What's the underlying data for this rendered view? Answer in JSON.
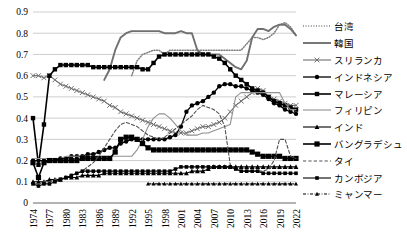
{
  "chart_data": {
    "type": "line",
    "title": "",
    "xlabel": "",
    "ylabel": "",
    "ylim": [
      0,
      0.9
    ],
    "grid": true,
    "legend_position": "right",
    "ytick_labels": [
      "0.9",
      "0.8",
      "0.7",
      "0.6",
      "0.5",
      "0.4",
      "0.3",
      "0.2",
      "0.1",
      "0"
    ],
    "ytick_values": [
      0.9,
      0.8,
      0.7,
      0.6,
      0.5,
      0.4,
      0.3,
      0.2,
      0.1,
      0
    ],
    "xtick_labels": [
      "1974",
      "1977",
      "1980",
      "1983",
      "1986",
      "1989",
      "1992",
      "1995",
      "1998",
      "2001",
      "2004",
      "2007",
      "2010",
      "2013",
      "2016",
      "2019",
      "2022"
    ],
    "x": [
      1974,
      1975,
      1976,
      1977,
      1978,
      1979,
      1980,
      1981,
      1982,
      1983,
      1984,
      1985,
      1986,
      1987,
      1988,
      1989,
      1990,
      1991,
      1992,
      1993,
      1994,
      1995,
      1996,
      1997,
      1998,
      1999,
      2000,
      2001,
      2002,
      2003,
      2004,
      2005,
      2006,
      2007,
      2008,
      2009,
      2010,
      2011,
      2012,
      2013,
      2014,
      2015,
      2016,
      2017,
      2018,
      2019,
      2020,
      2021,
      2022
    ],
    "series": [
      {
        "name": "台湾",
        "style": "dotted",
        "marker": "none",
        "color": "#808080",
        "values": [
          null,
          null,
          null,
          null,
          null,
          null,
          null,
          null,
          null,
          null,
          null,
          null,
          null,
          null,
          null,
          null,
          null,
          null,
          0.6,
          0.67,
          0.7,
          0.71,
          0.72,
          0.72,
          0.7,
          0.72,
          0.72,
          0.72,
          0.72,
          0.72,
          0.72,
          0.72,
          0.72,
          0.72,
          0.72,
          0.72,
          0.72,
          0.72,
          0.72,
          0.75,
          0.78,
          0.78,
          0.77,
          0.78,
          0.8,
          0.84,
          0.85,
          0.83,
          0.79
        ]
      },
      {
        "name": "韓国",
        "style": "solid",
        "marker": "none",
        "color": "#707070",
        "values": [
          null,
          null,
          null,
          null,
          null,
          null,
          null,
          null,
          null,
          null,
          null,
          null,
          null,
          0.58,
          0.63,
          0.72,
          0.78,
          0.8,
          0.81,
          0.81,
          0.81,
          0.81,
          0.81,
          0.81,
          0.8,
          0.8,
          0.8,
          0.81,
          0.8,
          0.8,
          0.72,
          0.7,
          0.7,
          0.7,
          0.7,
          0.68,
          0.66,
          0.64,
          0.63,
          0.67,
          0.78,
          0.82,
          0.82,
          0.81,
          0.83,
          0.84,
          0.84,
          0.82,
          0.79
        ]
      },
      {
        "name": "スリランカ",
        "style": "solid",
        "marker": "x",
        "color": "#707070",
        "values": [
          0.6,
          0.6,
          0.59,
          0.6,
          0.58,
          0.56,
          0.55,
          0.54,
          0.53,
          0.52,
          0.51,
          0.5,
          0.49,
          0.48,
          0.46,
          0.45,
          0.43,
          0.42,
          0.41,
          0.4,
          0.39,
          0.38,
          0.37,
          0.36,
          0.35,
          0.34,
          0.33,
          0.33,
          0.33,
          0.34,
          0.35,
          0.36,
          0.36,
          0.37,
          0.38,
          0.4,
          0.43,
          0.46,
          0.48,
          0.5,
          0.52,
          0.54,
          0.53,
          0.5,
          0.49,
          0.48,
          0.47,
          0.46,
          0.46
        ]
      },
      {
        "name": "インドネシア",
        "style": "solid",
        "marker": "circle",
        "color": "#000000",
        "values": [
          0.2,
          0.2,
          0.2,
          0.2,
          0.2,
          0.21,
          0.21,
          0.22,
          0.22,
          0.22,
          0.23,
          0.23,
          0.24,
          0.25,
          0.26,
          0.26,
          0.28,
          0.29,
          0.3,
          0.3,
          0.3,
          0.3,
          0.3,
          0.3,
          0.3,
          0.31,
          0.32,
          0.36,
          0.43,
          0.46,
          0.47,
          0.48,
          0.5,
          0.52,
          0.55,
          0.56,
          0.56,
          0.55,
          0.55,
          0.54,
          0.53,
          0.52,
          0.51,
          0.49,
          0.47,
          0.46,
          0.44,
          0.43,
          0.42
        ]
      },
      {
        "name": "マレーシア",
        "style": "solid",
        "marker": "square",
        "color": "#000000",
        "values": [
          0.4,
          0.18,
          0.37,
          0.6,
          0.63,
          0.65,
          0.65,
          0.65,
          0.65,
          0.65,
          0.65,
          0.64,
          0.64,
          0.64,
          0.64,
          0.64,
          0.64,
          0.64,
          0.64,
          0.64,
          0.63,
          0.63,
          0.66,
          0.69,
          0.7,
          0.7,
          0.7,
          0.7,
          0.7,
          0.7,
          0.7,
          0.7,
          0.7,
          0.69,
          0.68,
          0.66,
          0.63,
          0.6,
          0.58,
          0.56,
          0.54,
          0.53,
          0.52,
          0.5,
          0.48,
          0.47,
          0.46,
          0.45,
          0.44
        ]
      },
      {
        "name": "フィリピン",
        "style": "solid",
        "marker": "none",
        "color": "#909090",
        "values": [
          0.21,
          0.21,
          0.21,
          0.21,
          0.21,
          0.21,
          0.22,
          0.22,
          0.22,
          0.22,
          0.22,
          0.22,
          0.22,
          0.22,
          0.22,
          0.22,
          0.22,
          0.22,
          0.22,
          0.25,
          0.3,
          0.36,
          0.4,
          0.42,
          0.42,
          0.4,
          0.37,
          0.34,
          0.32,
          0.32,
          0.32,
          0.33,
          0.33,
          0.34,
          0.35,
          0.36,
          0.37,
          0.5,
          0.52,
          0.52,
          0.52,
          0.52,
          0.52,
          0.52,
          0.52,
          0.52,
          0.47,
          0.44,
          0.44
        ]
      },
      {
        "name": "インド",
        "style": "solid",
        "marker": "triangle",
        "color": "#000000",
        "values": [
          0.1,
          0.1,
          0.1,
          0.11,
          0.11,
          0.11,
          0.12,
          0.12,
          0.12,
          0.13,
          0.13,
          0.13,
          0.13,
          0.14,
          0.14,
          0.14,
          0.14,
          0.14,
          0.14,
          0.14,
          0.14,
          0.14,
          0.14,
          0.14,
          0.14,
          0.14,
          0.14,
          0.14,
          0.14,
          0.15,
          0.15,
          0.15,
          0.16,
          0.17,
          0.17,
          0.17,
          0.17,
          0.17,
          0.17,
          0.17,
          0.17,
          0.17,
          0.17,
          0.17,
          0.17,
          0.17,
          0.17,
          0.17,
          0.17
        ]
      },
      {
        "name": "バングラデシュ",
        "style": "solid",
        "marker": "square-bold",
        "color": "#000000",
        "values": [
          0.19,
          0.12,
          0.19,
          0.2,
          0.2,
          0.2,
          0.2,
          0.2,
          0.2,
          0.21,
          0.21,
          0.21,
          0.21,
          0.21,
          0.21,
          0.24,
          0.3,
          0.31,
          0.31,
          0.3,
          0.28,
          0.26,
          0.25,
          0.25,
          0.25,
          0.25,
          0.25,
          0.25,
          0.25,
          0.25,
          0.25,
          0.25,
          0.25,
          0.25,
          0.25,
          0.25,
          0.25,
          0.25,
          0.25,
          0.25,
          0.24,
          0.23,
          0.22,
          0.22,
          0.22,
          0.22,
          0.21,
          0.21,
          0.21
        ]
      },
      {
        "name": "タイ",
        "style": "dashed",
        "marker": "none",
        "color": "#505050",
        "values": [
          0.09,
          0.09,
          0.1,
          0.1,
          0.11,
          0.12,
          0.12,
          0.13,
          0.14,
          0.15,
          0.17,
          0.19,
          0.22,
          0.26,
          0.3,
          0.34,
          0.37,
          0.38,
          0.37,
          0.36,
          0.34,
          0.32,
          0.31,
          0.3,
          0.31,
          0.33,
          0.35,
          0.37,
          0.39,
          0.41,
          0.44,
          0.46,
          0.45,
          0.44,
          0.42,
          0.36,
          0.18,
          0.16,
          0.15,
          0.15,
          0.15,
          0.15,
          0.15,
          0.16,
          0.2,
          0.3,
          0.3,
          0.22,
          0.21
        ]
      },
      {
        "name": "カンボジア",
        "style": "solid",
        "marker": "square-small",
        "color": "#000000",
        "values": [
          0.09,
          0.08,
          0.09,
          0.09,
          0.1,
          0.11,
          0.12,
          0.13,
          0.14,
          0.15,
          0.15,
          0.15,
          0.15,
          0.15,
          0.15,
          0.15,
          0.15,
          0.15,
          0.15,
          0.15,
          0.15,
          0.15,
          0.15,
          0.15,
          0.15,
          0.15,
          0.16,
          0.17,
          0.17,
          0.17,
          0.17,
          0.17,
          0.17,
          0.17,
          0.17,
          0.17,
          0.17,
          0.16,
          0.15,
          0.15,
          0.15,
          0.15,
          0.14,
          0.14,
          0.14,
          0.14,
          0.14,
          0.14,
          0.14
        ]
      },
      {
        "name": "ミャンマー",
        "style": "dash-dot",
        "marker": "triangle-small",
        "color": "#000000",
        "values": [
          null,
          null,
          null,
          null,
          null,
          null,
          null,
          null,
          null,
          null,
          null,
          null,
          null,
          null,
          null,
          null,
          null,
          null,
          null,
          null,
          null,
          0.09,
          0.09,
          0.09,
          0.09,
          0.09,
          0.09,
          0.09,
          0.09,
          0.09,
          0.09,
          0.09,
          0.09,
          0.09,
          0.09,
          0.09,
          0.09,
          0.09,
          0.09,
          0.09,
          0.09,
          0.09,
          0.09,
          0.09,
          0.09,
          0.09,
          0.09,
          0.09,
          0.09
        ]
      }
    ]
  },
  "legend": {
    "items": [
      {
        "label": "台湾",
        "icon": "legend-line-dotted"
      },
      {
        "label": "韓国",
        "icon": "legend-line-solid-thick"
      },
      {
        "label": "スリランカ",
        "icon": "legend-line-marker-x"
      },
      {
        "label": "インドネシア",
        "icon": "legend-line-marker-circle"
      },
      {
        "label": "マレーシア",
        "icon": "legend-line-marker-square"
      },
      {
        "label": "フィリピン",
        "icon": "legend-line-solid-thin"
      },
      {
        "label": "インド",
        "icon": "legend-line-marker-triangle"
      },
      {
        "label": "バングラデシュ",
        "icon": "legend-line-marker-square-bold"
      },
      {
        "label": "タイ",
        "icon": "legend-line-dashed"
      },
      {
        "label": "カンボジア",
        "icon": "legend-line-marker-square-small"
      },
      {
        "label": "ミャンマー",
        "icon": "legend-line-dashdot-triangle"
      }
    ]
  }
}
